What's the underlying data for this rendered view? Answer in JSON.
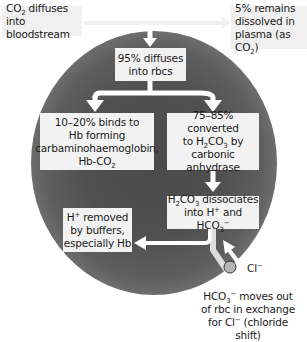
{
  "colors": {
    "cell_center": "#4a4a4a",
    "cell_rim": "#858585",
    "box_fill": "#f2f2f2",
    "arrow": "#ffffff",
    "chloride_ion": "#b5b5b5",
    "text": "#1a1a1a"
  },
  "boxes": {
    "co2_entry": {
      "line1_pre": "CO",
      "line1_sub": "2",
      "line1_post": " diffuses",
      "line2": "into bloodstream"
    },
    "dissolved": {
      "line1": "5% remains",
      "line2": "dissolved in",
      "line3_pre": "plasma (as CO",
      "line3_sub": "2",
      "line3_post": ")"
    },
    "rbc_entry": {
      "line1": "95% diffuses",
      "line2": "into rbcs"
    },
    "carbamino": {
      "line1": "10–20% binds to",
      "line2": "Hb forming",
      "line3": "carbaminohaemoglobin,",
      "line4_pre": "Hb-CO",
      "line4_sub": "2"
    },
    "carbonic": {
      "line1": "75–85% converted",
      "line2_pre": "to H",
      "line2_sub1": "2",
      "line2_mid": "CO",
      "line2_sub2": "3",
      "line2_post": " by",
      "line3": "carbonic anhydrase"
    },
    "dissociates": {
      "line1_pre": "H",
      "line1_sub1": "2",
      "line1_mid": "CO",
      "line1_sub2": "3",
      "line1_post": " dissociates",
      "line2_pre": "into H",
      "line2_sup": "+",
      "line2_mid": " and HCO",
      "line2_sub": "3",
      "line2_sup2": "−"
    },
    "buffers": {
      "line1_pre": "H",
      "line1_sup": "+",
      "line1_post": " removed",
      "line2": "by buffers,",
      "line3": "especially Hb"
    }
  },
  "labels": {
    "chloride": {
      "pre": "Cl",
      "sup": "−"
    },
    "chloride_shift": {
      "line1_pre": "HCO",
      "line1_sub": "3",
      "line1_sup": "−",
      "line1_post": " moves out",
      "line2": "of rbc in exchange",
      "line3_pre": "for Cl",
      "line3_sup": "−",
      "line3_post": " (chloride shift)"
    }
  }
}
